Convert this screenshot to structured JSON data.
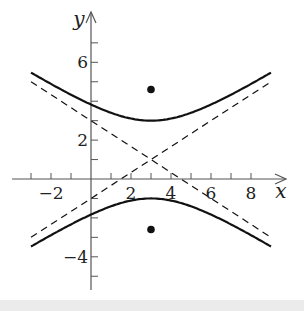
{
  "chart_data": {
    "type": "line",
    "title": "",
    "xlabel": "x",
    "ylabel": "y",
    "xlim": [
      -3.2,
      9.7
    ],
    "ylim": [
      -5.7,
      8.5
    ],
    "grid": false,
    "x_ticks": [
      -3,
      -2,
      -1,
      1,
      2,
      3,
      4,
      5,
      6,
      7,
      8
    ],
    "x_tick_labels": [
      {
        "value": -2,
        "label": "−2"
      },
      {
        "value": 2,
        "label": "2"
      },
      {
        "value": 4,
        "label": "4"
      },
      {
        "value": 6,
        "label": "6"
      },
      {
        "value": 8,
        "label": "8"
      }
    ],
    "y_ticks": [
      -5,
      -4,
      -3,
      -2,
      -1,
      1,
      2,
      3,
      4,
      5,
      6,
      7
    ],
    "y_tick_labels": [
      {
        "value": 6,
        "label": "6"
      },
      {
        "value": 2,
        "label": "2"
      },
      {
        "value": -4,
        "label": "−4"
      }
    ],
    "series": [
      {
        "name": "hyperbola upper branch",
        "style": "solid",
        "equation": "(y-1)^2/4 - (x-3)^2/9 = 1, y > 1",
        "x_range": [
          -3,
          9
        ]
      },
      {
        "name": "hyperbola lower branch",
        "style": "solid",
        "equation": "(y-1)^2/4 - (x-3)^2/9 = 1, y < 1",
        "x_range": [
          -3,
          9
        ]
      },
      {
        "name": "asymptote 1",
        "style": "dashed",
        "equation": "y = 1 + (2/3)(x-3)",
        "x_range": [
          -3,
          9
        ]
      },
      {
        "name": "asymptote 2",
        "style": "dashed",
        "equation": "y = 1 - (2/3)(x-3)",
        "x_range": [
          -3,
          9
        ]
      }
    ],
    "points": [
      {
        "name": "focus upper",
        "x": 3,
        "y": 4.6
      },
      {
        "name": "focus lower",
        "x": 3,
        "y": -2.6
      }
    ],
    "center": {
      "x": 3,
      "y": 1
    },
    "vertices": [
      {
        "x": 3,
        "y": 3
      },
      {
        "x": 3,
        "y": -1
      }
    ]
  },
  "colors": {
    "curve": "#111111",
    "axis": "#555555",
    "background": "#ffffff",
    "strip": "#ebebeb"
  }
}
